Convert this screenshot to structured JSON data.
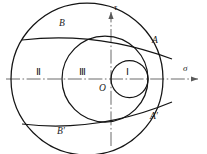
{
  "figure": {
    "kind": "mohr-circles-diagram",
    "background": "#ffffff",
    "stroke": "#1a1a1a",
    "axis_color": "#555555",
    "axes": {
      "horizontal_label": "σ",
      "vertical_label": "τ",
      "origin_label": "O"
    },
    "regions": {
      "circle_one": "Ⅰ",
      "circle_two": "Ⅱ",
      "circle_three": "Ⅲ"
    },
    "points": {
      "a": "A",
      "a_prime": "A′",
      "b": "B",
      "b_prime": "B′"
    }
  },
  "chart_data": {
    "type": "scatter",
    "title": "",
    "xlabel": "σ",
    "ylabel": "τ",
    "grid": false,
    "legend": "none",
    "origin": {
      "x": 111,
      "y": 79
    },
    "xlim": [
      0,
      207
    ],
    "ylim": [
      154,
      0
    ],
    "circles": [
      {
        "name": "Ⅰ",
        "cx": 129.5,
        "cy": 79,
        "r": 18.5,
        "label_x": 127,
        "label_y": 72
      },
      {
        "name": "Ⅲ",
        "cx": 105,
        "cy": 79,
        "r": 43,
        "label_x": 83,
        "label_y": 72
      },
      {
        "name": "Ⅱ",
        "cx": 87,
        "cy": 79,
        "r": 76,
        "label_x": 40,
        "label_y": 72
      }
    ],
    "tangent_lines": [
      {
        "name": "upper-envelope",
        "x1": 22,
        "y1": 40,
        "x2": 172,
        "y2": 59
      },
      {
        "name": "lower-envelope",
        "x1": 22,
        "y1": 124,
        "x2": 172,
        "y2": 102
      }
    ],
    "annotations": [
      {
        "text": "A",
        "x": 155,
        "y": 42
      },
      {
        "text": "A′",
        "x": 155,
        "y": 118
      },
      {
        "text": "B",
        "x": 62,
        "y": 25
      },
      {
        "text": "B′",
        "x": 62,
        "y": 133
      },
      {
        "text": "O",
        "x": 103,
        "y": 90
      },
      {
        "text": "σ",
        "x": 187,
        "y": 70
      },
      {
        "text": "τ",
        "x": 118,
        "y": 10
      }
    ]
  }
}
